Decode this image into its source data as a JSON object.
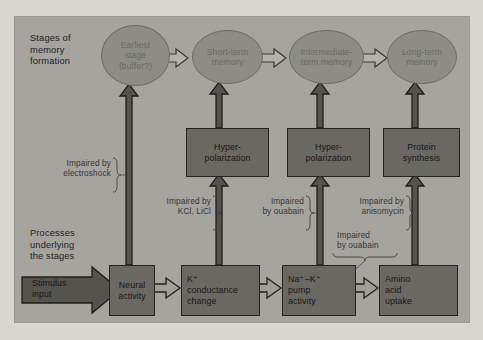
{
  "figure": {
    "type": "flow-diagram",
    "background_color": "#d8d6d1",
    "panel_color": "#a5a49f",
    "box_color": "#6a6862",
    "ellipse_color": "#8d8c87",
    "outline_color": "#26241f"
  },
  "row_labels": {
    "stages": "Stages of\nmemory\nformation",
    "processes": "Processes\nunderlying\nthe stages"
  },
  "stages": [
    {
      "id": "earliest",
      "label": "Earliest\nstage\n(buffer?)"
    },
    {
      "id": "short-term",
      "label": "Short-term\nmemory"
    },
    {
      "id": "intermediate",
      "label": "Intermediate-\nterm memory"
    },
    {
      "id": "long-term",
      "label": "Long-term\nmemory"
    }
  ],
  "middle_boxes": [
    {
      "id": "hyperpolarization-1",
      "label": "Hyper-\npolarization"
    },
    {
      "id": "hyperpolarization-2",
      "label": "Hyper-\npolarization"
    },
    {
      "id": "protein-synthesis",
      "label": "Protein\nsynthesis"
    }
  ],
  "process_boxes": [
    {
      "id": "neural-activity",
      "label": "Neural\nactivity"
    },
    {
      "id": "k-conductance",
      "label": "K⁺\nconductance\nchange"
    },
    {
      "id": "na-k-pump",
      "label": "Na⁺−K⁺\npump\nactivity"
    },
    {
      "id": "amino-acid-uptake",
      "label": "Amino\nacid\nuptake"
    }
  ],
  "stimulus": {
    "id": "stimulus-input",
    "label": "Stimulus\ninput"
  },
  "annotations": [
    {
      "id": "electroshock",
      "label": "Impaired by\nelectroshock"
    },
    {
      "id": "kcl-licl",
      "label": "Impaired by\nKCl, LiCl"
    },
    {
      "id": "ouabain-1",
      "label": "Impaired\nby ouabain"
    },
    {
      "id": "anisomycin",
      "label": "Impaired by\nanisomycin"
    },
    {
      "id": "ouabain-2",
      "label": "Impaired\nby ouabain"
    }
  ]
}
